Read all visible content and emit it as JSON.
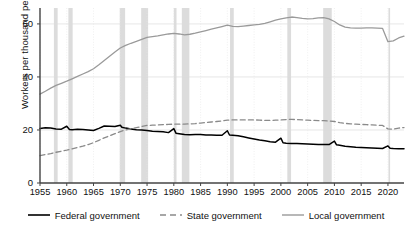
{
  "chart_data": {
    "type": "line",
    "title": "",
    "xlabel": "",
    "ylabel": "Workers per thousand people",
    "xlim": [
      1955,
      2023
    ],
    "ylim": [
      0,
      66
    ],
    "yticks": [
      0,
      20,
      40,
      60
    ],
    "xticks": [
      1955,
      1960,
      1965,
      1970,
      1975,
      1980,
      1985,
      1990,
      1995,
      2000,
      2005,
      2010,
      2015,
      2020
    ],
    "grid": true,
    "legend_position": "bottom",
    "recession_bands": [
      {
        "start": 1957.6,
        "end": 1958.3
      },
      {
        "start": 1960.3,
        "end": 1961.1
      },
      {
        "start": 1969.9,
        "end": 1970.9
      },
      {
        "start": 1973.9,
        "end": 1975.2
      },
      {
        "start": 1980.0,
        "end": 1980.5
      },
      {
        "start": 1981.5,
        "end": 1982.9
      },
      {
        "start": 1990.5,
        "end": 1991.2
      },
      {
        "start": 2001.2,
        "end": 2001.9
      },
      {
        "start": 2007.9,
        "end": 2009.5
      },
      {
        "start": 2020.1,
        "end": 2020.4
      }
    ],
    "series": [
      {
        "name": "Federal government",
        "color": "#000000",
        "style": "solid",
        "points": [
          [
            1955,
            20.6
          ],
          [
            1956,
            20.8
          ],
          [
            1957,
            20.7
          ],
          [
            1958,
            20.4
          ],
          [
            1959,
            20.3
          ],
          [
            1960,
            21.4
          ],
          [
            1960.5,
            20.2
          ],
          [
            1961,
            20.1
          ],
          [
            1962,
            20.3
          ],
          [
            1963,
            20.2
          ],
          [
            1964,
            20.0
          ],
          [
            1965,
            19.8
          ],
          [
            1966,
            20.6
          ],
          [
            1967,
            21.5
          ],
          [
            1968,
            21.4
          ],
          [
            1969,
            21.3
          ],
          [
            1970,
            21.8
          ],
          [
            1970.3,
            21.0
          ],
          [
            1971,
            20.7
          ],
          [
            1972,
            20.4
          ],
          [
            1973,
            20.1
          ],
          [
            1974,
            20.0
          ],
          [
            1975,
            19.8
          ],
          [
            1976,
            19.5
          ],
          [
            1977,
            19.4
          ],
          [
            1978,
            19.3
          ],
          [
            1979,
            19.0
          ],
          [
            1980,
            20.5
          ],
          [
            1980.4,
            18.8
          ],
          [
            1981,
            18.6
          ],
          [
            1982,
            18.3
          ],
          [
            1983,
            18.2
          ],
          [
            1984,
            18.3
          ],
          [
            1985,
            18.3
          ],
          [
            1986,
            18.1
          ],
          [
            1987,
            18.1
          ],
          [
            1988,
            18.0
          ],
          [
            1989,
            18.0
          ],
          [
            1990,
            19.7
          ],
          [
            1990.4,
            18.1
          ],
          [
            1991,
            18.0
          ],
          [
            1992,
            17.8
          ],
          [
            1993,
            17.4
          ],
          [
            1994,
            17.0
          ],
          [
            1995,
            16.6
          ],
          [
            1996,
            16.2
          ],
          [
            1997,
            15.9
          ],
          [
            1998,
            15.6
          ],
          [
            1999,
            15.4
          ],
          [
            2000,
            16.9
          ],
          [
            2000.4,
            15.2
          ],
          [
            2001,
            15.0
          ],
          [
            2002,
            14.9
          ],
          [
            2003,
            14.9
          ],
          [
            2004,
            14.8
          ],
          [
            2005,
            14.7
          ],
          [
            2006,
            14.6
          ],
          [
            2007,
            14.5
          ],
          [
            2008,
            14.5
          ],
          [
            2009,
            14.5
          ],
          [
            2010,
            15.8
          ],
          [
            2010.4,
            14.4
          ],
          [
            2011,
            14.2
          ],
          [
            2012,
            13.9
          ],
          [
            2013,
            13.7
          ],
          [
            2014,
            13.5
          ],
          [
            2015,
            13.4
          ],
          [
            2016,
            13.3
          ],
          [
            2017,
            13.2
          ],
          [
            2018,
            13.1
          ],
          [
            2019,
            13.0
          ],
          [
            2020,
            14.0
          ],
          [
            2020.4,
            13.1
          ],
          [
            2021,
            13.0
          ],
          [
            2022,
            12.9
          ],
          [
            2023,
            12.9
          ]
        ]
      },
      {
        "name": "State government",
        "color": "#8a8a8a",
        "style": "dashed",
        "points": [
          [
            1955,
            10.3
          ],
          [
            1956,
            10.7
          ],
          [
            1957,
            11.1
          ],
          [
            1958,
            11.6
          ],
          [
            1959,
            12.0
          ],
          [
            1960,
            12.4
          ],
          [
            1961,
            12.9
          ],
          [
            1962,
            13.4
          ],
          [
            1963,
            13.9
          ],
          [
            1964,
            14.5
          ],
          [
            1965,
            15.2
          ],
          [
            1966,
            16.1
          ],
          [
            1967,
            17.0
          ],
          [
            1968,
            17.8
          ],
          [
            1969,
            18.6
          ],
          [
            1970,
            19.4
          ],
          [
            1971,
            20.0
          ],
          [
            1972,
            20.5
          ],
          [
            1973,
            20.9
          ],
          [
            1974,
            21.3
          ],
          [
            1975,
            21.7
          ],
          [
            1976,
            21.8
          ],
          [
            1977,
            21.9
          ],
          [
            1978,
            22.0
          ],
          [
            1979,
            22.1
          ],
          [
            1980,
            22.2
          ],
          [
            1981,
            22.2
          ],
          [
            1982,
            22.2
          ],
          [
            1983,
            22.3
          ],
          [
            1984,
            22.4
          ],
          [
            1985,
            22.6
          ],
          [
            1986,
            22.8
          ],
          [
            1987,
            23.0
          ],
          [
            1988,
            23.2
          ],
          [
            1989,
            23.4
          ],
          [
            1990,
            23.7
          ],
          [
            1991,
            23.8
          ],
          [
            1992,
            23.8
          ],
          [
            1993,
            23.8
          ],
          [
            1994,
            23.8
          ],
          [
            1995,
            23.8
          ],
          [
            1996,
            23.7
          ],
          [
            1997,
            23.6
          ],
          [
            1998,
            23.6
          ],
          [
            1999,
            23.7
          ],
          [
            2000,
            23.8
          ],
          [
            2001,
            23.9
          ],
          [
            2002,
            24.0
          ],
          [
            2003,
            23.9
          ],
          [
            2004,
            23.8
          ],
          [
            2005,
            23.7
          ],
          [
            2006,
            23.6
          ],
          [
            2007,
            23.5
          ],
          [
            2008,
            23.5
          ],
          [
            2009,
            23.4
          ],
          [
            2010,
            23.2
          ],
          [
            2011,
            22.8
          ],
          [
            2012,
            22.5
          ],
          [
            2013,
            22.3
          ],
          [
            2014,
            22.2
          ],
          [
            2015,
            22.1
          ],
          [
            2016,
            22.0
          ],
          [
            2017,
            21.9
          ],
          [
            2018,
            21.8
          ],
          [
            2019,
            21.7
          ],
          [
            2020,
            20.4
          ],
          [
            2021,
            20.3
          ],
          [
            2022,
            20.7
          ],
          [
            2023,
            20.9
          ]
        ]
      },
      {
        "name": "Local government",
        "color": "#9a9a9a",
        "style": "solid",
        "points": [
          [
            1955,
            33.5
          ],
          [
            1956,
            34.6
          ],
          [
            1957,
            35.8
          ],
          [
            1958,
            36.8
          ],
          [
            1959,
            37.6
          ],
          [
            1960,
            38.4
          ],
          [
            1961,
            39.3
          ],
          [
            1962,
            40.2
          ],
          [
            1963,
            41.1
          ],
          [
            1964,
            42.0
          ],
          [
            1965,
            43.1
          ],
          [
            1966,
            44.6
          ],
          [
            1967,
            46.2
          ],
          [
            1968,
            47.8
          ],
          [
            1969,
            49.4
          ],
          [
            1970,
            50.9
          ],
          [
            1971,
            51.9
          ],
          [
            1972,
            52.7
          ],
          [
            1973,
            53.4
          ],
          [
            1974,
            54.2
          ],
          [
            1975,
            54.9
          ],
          [
            1976,
            55.2
          ],
          [
            1977,
            55.5
          ],
          [
            1978,
            55.9
          ],
          [
            1979,
            56.2
          ],
          [
            1980,
            56.4
          ],
          [
            1981,
            56.2
          ],
          [
            1982,
            55.9
          ],
          [
            1983,
            56.1
          ],
          [
            1984,
            56.5
          ],
          [
            1985,
            57.0
          ],
          [
            1986,
            57.5
          ],
          [
            1987,
            58.0
          ],
          [
            1988,
            58.5
          ],
          [
            1989,
            59.0
          ],
          [
            1990,
            59.5
          ],
          [
            1991,
            59.1
          ],
          [
            1992,
            59.0
          ],
          [
            1993,
            59.2
          ],
          [
            1994,
            59.4
          ],
          [
            1995,
            59.6
          ],
          [
            1996,
            59.8
          ],
          [
            1997,
            60.2
          ],
          [
            1998,
            60.8
          ],
          [
            1999,
            61.4
          ],
          [
            2000,
            61.9
          ],
          [
            2001,
            62.3
          ],
          [
            2002,
            62.6
          ],
          [
            2003,
            62.4
          ],
          [
            2004,
            62.1
          ],
          [
            2005,
            61.9
          ],
          [
            2006,
            62.0
          ],
          [
            2007,
            62.3
          ],
          [
            2008,
            62.4
          ],
          [
            2009,
            61.9
          ],
          [
            2010,
            60.9
          ],
          [
            2011,
            59.6
          ],
          [
            2012,
            58.8
          ],
          [
            2013,
            58.5
          ],
          [
            2014,
            58.4
          ],
          [
            2015,
            58.4
          ],
          [
            2016,
            58.5
          ],
          [
            2017,
            58.5
          ],
          [
            2018,
            58.4
          ],
          [
            2019,
            58.3
          ],
          [
            2020,
            53.3
          ],
          [
            2021,
            53.6
          ],
          [
            2022,
            54.7
          ],
          [
            2023,
            55.4
          ]
        ]
      }
    ]
  },
  "legend": {
    "items": [
      {
        "label": "Federal government",
        "style": "solid",
        "color": "#000000"
      },
      {
        "label": "State government",
        "style": "dashed",
        "color": "#8a8a8a"
      },
      {
        "label": "Local government",
        "style": "solid",
        "color": "#9a9a9a"
      }
    ]
  },
  "axis": {
    "ylabel": "Workers per thousand people"
  }
}
